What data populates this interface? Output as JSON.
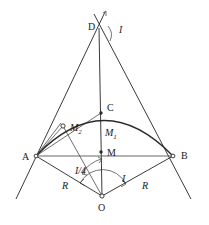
{
  "figure": {
    "kind": "geometry-diagram",
    "stroke_color": "#3a3a3a",
    "arc_color": "#2b2b2b",
    "background": "#ffffff"
  },
  "points": {
    "D": {
      "label": "D",
      "x": 99,
      "y": 26,
      "label_x": 88,
      "label_y": 30
    },
    "C": {
      "label": "C",
      "x": 101,
      "y": 113,
      "label_x": 107,
      "label_y": 111
    },
    "A": {
      "label": "A",
      "x": 36,
      "y": 156,
      "label_x": 22,
      "label_y": 160
    },
    "B": {
      "label": "B",
      "x": 173,
      "y": 156,
      "label_x": 181,
      "label_y": 159
    },
    "M": {
      "label": "M",
      "x": 101,
      "y": 152,
      "label_x": 107,
      "label_y": 156
    },
    "O": {
      "label": "O",
      "x": 102,
      "y": 196,
      "label_x": 98,
      "label_y": 211
    },
    "M2": {
      "label": "M",
      "sub": "2",
      "x": 63,
      "y": 126,
      "label_x": 70,
      "label_y": 131
    },
    "M1": {
      "label": "M",
      "sub": "1",
      "x": 101,
      "y": 130,
      "label_x": 105,
      "label_y": 136
    }
  },
  "angle_labels": {
    "I_top": {
      "text": "I",
      "x": 119,
      "y": 33
    },
    "I_bottom": {
      "text": "I",
      "x": 122,
      "y": 182
    },
    "I_quarter": {
      "text": "I/4",
      "x": 79,
      "y": 174
    }
  },
  "radius_labels": {
    "left": {
      "text": "R",
      "x": 62,
      "y": 189
    },
    "right": {
      "text": "R",
      "x": 142,
      "y": 189
    }
  }
}
